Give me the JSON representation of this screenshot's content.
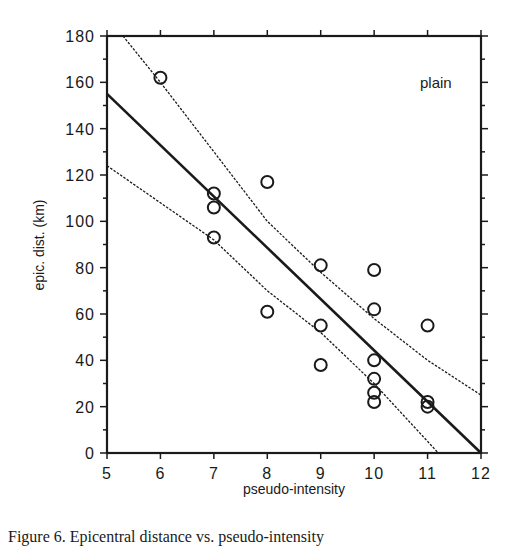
{
  "chart_data": {
    "type": "scatter",
    "title": "",
    "xlabel": "pseudo-intensity",
    "ylabel": "epic. dist. (km)",
    "xlim": [
      5,
      12
    ],
    "ylim": [
      0,
      180
    ],
    "x_ticks": [
      5,
      6,
      7,
      8,
      9,
      10,
      11,
      12
    ],
    "y_ticks": [
      0,
      20,
      40,
      60,
      80,
      100,
      120,
      140,
      160,
      180
    ],
    "grid": false,
    "legend": null,
    "annotations": [
      "plain"
    ],
    "series": [
      {
        "name": "observations",
        "kind": "scatter",
        "marker": "open-circle",
        "points": [
          [
            6,
            162
          ],
          [
            7,
            112
          ],
          [
            7,
            106
          ],
          [
            7,
            93
          ],
          [
            8,
            117
          ],
          [
            8,
            61
          ],
          [
            9,
            81
          ],
          [
            9,
            55
          ],
          [
            9,
            38
          ],
          [
            10,
            79
          ],
          [
            10,
            62
          ],
          [
            10,
            40
          ],
          [
            10,
            32
          ],
          [
            10,
            26
          ],
          [
            10,
            22
          ],
          [
            11,
            55
          ],
          [
            11,
            22
          ],
          [
            11,
            20
          ]
        ]
      },
      {
        "name": "regression",
        "kind": "line",
        "style": "solid-thick",
        "points": [
          [
            5,
            155
          ],
          [
            12,
            0
          ]
        ]
      },
      {
        "name": "upper-confidence",
        "kind": "line",
        "style": "dashed",
        "points": [
          [
            5.3,
            180
          ],
          [
            6,
            160
          ],
          [
            7,
            130
          ],
          [
            8,
            100
          ],
          [
            9,
            78
          ],
          [
            10,
            58
          ],
          [
            11,
            40
          ],
          [
            12,
            25
          ]
        ]
      },
      {
        "name": "lower-confidence",
        "kind": "line",
        "style": "dashed",
        "points": [
          [
            5,
            124
          ],
          [
            6,
            108
          ],
          [
            7,
            92
          ],
          [
            8,
            70
          ],
          [
            9,
            52
          ],
          [
            10,
            30
          ],
          [
            11.2,
            0
          ]
        ]
      }
    ]
  },
  "figure": {
    "annotation": "plain",
    "caption": "Figure 6. Epicentral distance vs. pseudo-intensity"
  }
}
